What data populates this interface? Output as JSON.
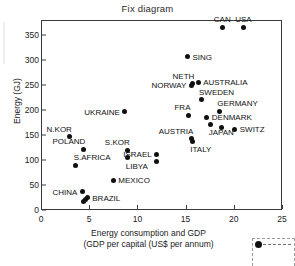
{
  "chart_data": {
    "type": "scatter",
    "title": "Fix diagram",
    "xlabel": "Energy consumption and GDP",
    "xlabel_line2": "(GDP per capital (US$ per annum)",
    "ylabel": "Energy (GJ)",
    "xlim": [
      0,
      25
    ],
    "ylim": [
      0,
      380
    ],
    "xticks": [
      0,
      5,
      10,
      15,
      20,
      25
    ],
    "yticks": [
      0,
      50,
      100,
      150,
      200,
      250,
      300,
      350
    ],
    "grid": false,
    "legend": "none",
    "marker": "filled-diamond",
    "marker_color": "#101010",
    "points": [
      {
        "label": "CAN",
        "x": 18.8,
        "y": 365,
        "lpos": "above"
      },
      {
        "label": "USA",
        "x": 21.0,
        "y": 365,
        "lpos": "above"
      },
      {
        "label": "SING",
        "x": 15.2,
        "y": 307,
        "lpos": "right"
      },
      {
        "label": "AUSTRALIA",
        "x": 16.3,
        "y": 256,
        "lpos": "right"
      },
      {
        "label": "NETH",
        "x": 15.7,
        "y": 253,
        "lpos": "above-left"
      },
      {
        "label": "NORWAY",
        "x": 15.6,
        "y": 250,
        "lpos": "left"
      },
      {
        "label": "SWEDEN",
        "x": 16.6,
        "y": 221,
        "lpos": "above-right"
      },
      {
        "label": "GERMANY",
        "x": 18.5,
        "y": 198,
        "lpos": "above-right"
      },
      {
        "label": "UKRAINE",
        "x": 8.7,
        "y": 197,
        "lpos": "left"
      },
      {
        "label": "FRA",
        "x": 15.3,
        "y": 190,
        "lpos": "above-left"
      },
      {
        "label": "DENMARK",
        "x": 17.2,
        "y": 186,
        "lpos": "right"
      },
      {
        "label": "JAPAN",
        "x": 17.6,
        "y": 172,
        "lpos": "below-right"
      },
      {
        "label": "SWITZ",
        "x": 20.1,
        "y": 162,
        "lpos": "right"
      },
      {
        "label": "JAPAN2",
        "x": 18.7,
        "y": 165,
        "lpos": "none"
      },
      {
        "label": "N.KOR",
        "x": 3.0,
        "y": 147,
        "lpos": "above-left"
      },
      {
        "label": "AUSTRIA",
        "x": 15.6,
        "y": 143,
        "lpos": "above-left"
      },
      {
        "label": "ITALY",
        "x": 15.7,
        "y": 138,
        "lpos": "below-right"
      },
      {
        "label": "POLAND",
        "x": 4.4,
        "y": 122,
        "lpos": "above-left"
      },
      {
        "label": "S.KOR",
        "x": 9.0,
        "y": 120,
        "lpos": "above-left"
      },
      {
        "label": "ISRAEL",
        "x": 12.0,
        "y": 112,
        "lpos": "left"
      },
      {
        "label": "LIBYA",
        "x": 9.0,
        "y": 105,
        "lpos": "below-right"
      },
      {
        "label": "ISRAEL2",
        "x": 12.0,
        "y": 98,
        "lpos": "none"
      },
      {
        "label": "S.AFRICA",
        "x": 3.6,
        "y": 90,
        "lpos": "above-right"
      },
      {
        "label": "MEXICO",
        "x": 7.5,
        "y": 60,
        "lpos": "right"
      },
      {
        "label": "CHINA",
        "x": 4.3,
        "y": 37,
        "lpos": "left"
      },
      {
        "label": "BRAZIL",
        "x": 4.8,
        "y": 25,
        "lpos": "right"
      },
      {
        "label": "BRAZIL2",
        "x": 4.6,
        "y": 21,
        "lpos": "none"
      },
      {
        "label": "BRAZIL3",
        "x": 4.4,
        "y": 18,
        "lpos": "none"
      }
    ]
  },
  "labels": {
    "CAN": "CAN",
    "USA": "USA",
    "SING": "SING",
    "AUSTRALIA": "AUSTRALIA",
    "NETH": "NETH",
    "NORWAY": "NORWAY",
    "SWEDEN": "SWEDEN",
    "GERMANY": "GERMANY",
    "UKRAINE": "UKRAINE",
    "FRA": "FRA",
    "DENMARK": "DENMARK",
    "JAPAN": "JAPAN",
    "SWITZ": "SWITZ",
    "N_KOR": "N.KOR",
    "AUSTRIA": "AUSTRIA",
    "ITALY": "ITALY",
    "POLAND": "POLAND",
    "S_KOR": "S.KOR",
    "ISRAEL": "ISRAEL",
    "LIBYA": "LIBYA",
    "S_AFRICA": "S.AFRICA",
    "MEXICO": "MEXICO",
    "CHINA": "CHINA",
    "BRAZIL": "BRAZIL"
  }
}
